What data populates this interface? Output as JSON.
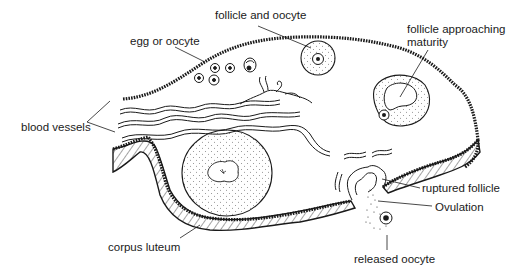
{
  "diagram": {
    "colors": {
      "ink": "#1a1a1a",
      "background": "#ffffff"
    },
    "labels": [
      {
        "id": "egg",
        "text": "egg or oocyte",
        "x": 130,
        "y": 35
      },
      {
        "id": "follicle-oocyte",
        "text": "follicle and oocyte",
        "x": 215,
        "y": 9
      },
      {
        "id": "follicle-maturity-1",
        "text": "follicle approaching",
        "x": 407,
        "y": 23
      },
      {
        "id": "follicle-maturity-2",
        "text": "maturity",
        "x": 407,
        "y": 36
      },
      {
        "id": "blood-vessels",
        "text": "blood vessels",
        "x": 21,
        "y": 121
      },
      {
        "id": "ruptured-follicle",
        "text": "ruptured follicle",
        "x": 422,
        "y": 182
      },
      {
        "id": "ovulation",
        "text": "Ovulation",
        "x": 435,
        "y": 201
      },
      {
        "id": "corpus-luteum",
        "text": "corpus luteum",
        "x": 108,
        "y": 241
      },
      {
        "id": "released-oocyte",
        "text": "released oocyte",
        "x": 354,
        "y": 253
      }
    ]
  }
}
